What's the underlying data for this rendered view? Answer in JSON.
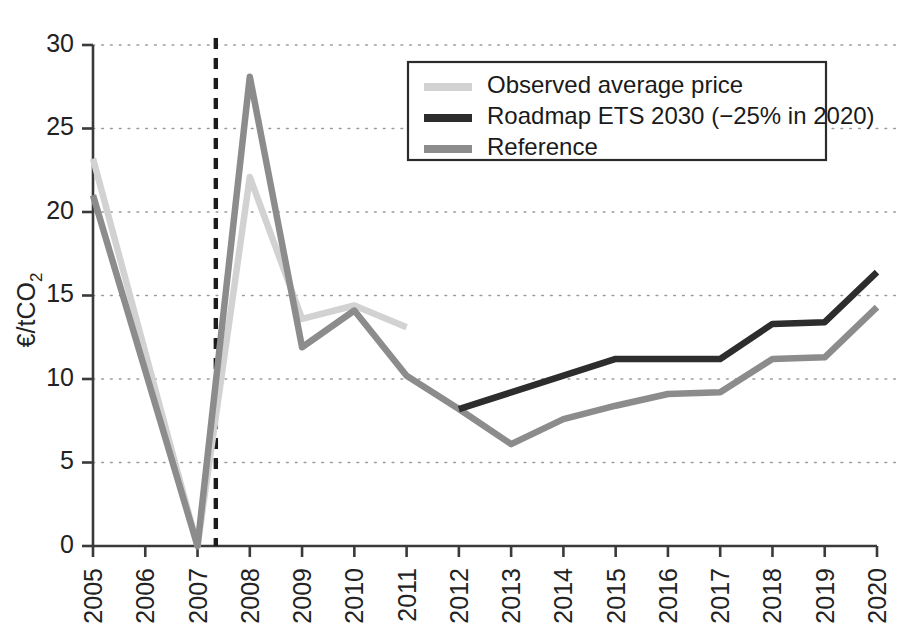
{
  "chart_data": {
    "type": "line",
    "title": "",
    "xlabel": "",
    "ylabel": "€/tCO2",
    "ylabel_base": "€/tCO",
    "ylabel_sub": "2",
    "categories": [
      "2005",
      "2006",
      "2007",
      "2008",
      "2009",
      "2010",
      "2011",
      "2012",
      "2013",
      "2014",
      "2015",
      "2016",
      "2017",
      "2018",
      "2019",
      "2020"
    ],
    "x": [
      2005,
      2006,
      2007,
      2008,
      2009,
      2010,
      2011,
      2012,
      2013,
      2014,
      2015,
      2016,
      2017,
      2018,
      2019,
      2020
    ],
    "xlim": [
      2005,
      2020
    ],
    "ylim": [
      0,
      30
    ],
    "yticks": [
      0,
      5,
      10,
      15,
      20,
      25,
      30
    ],
    "ytick_labels": [
      "0",
      "5",
      "10",
      "15",
      "20",
      "25",
      "30"
    ],
    "grid": true,
    "grid_axis": "y",
    "legend_position": "top-center-right",
    "series": [
      {
        "name": "Observed average price",
        "color": "#d2d2d2",
        "x": [
          2005,
          2006,
          2007,
          2008,
          2009,
          2010,
          2011
        ],
        "values": [
          23.2,
          null,
          0.0,
          22.1,
          13.6,
          14.4,
          13.1
        ]
      },
      {
        "name": "Roadmap ETS 2030 (−25% in 2020)",
        "color": "#2d2d2d",
        "x": [
          2012,
          2013,
          2014,
          2015,
          2016,
          2017,
          2018,
          2019,
          2020
        ],
        "values": [
          8.2,
          9.2,
          10.2,
          11.2,
          11.2,
          11.2,
          13.3,
          13.4,
          16.4
        ]
      },
      {
        "name": "Reference",
        "color": "#8c8c8c",
        "x": [
          2005,
          2006,
          2007,
          2008,
          2009,
          2010,
          2011,
          2012,
          2013,
          2014,
          2015,
          2016,
          2017,
          2018,
          2019,
          2020
        ],
        "values": [
          21.0,
          null,
          0.0,
          28.1,
          11.9,
          14.1,
          10.2,
          8.2,
          6.1,
          7.6,
          8.4,
          9.1,
          9.2,
          11.2,
          11.3,
          14.3
        ]
      }
    ],
    "annotations": [
      {
        "name": "vertical-divider",
        "type": "vline",
        "x": 2007.35,
        "style": "dashed",
        "color": "#1b1b1b"
      }
    ]
  },
  "legend": {
    "entries": [
      {
        "label": "Observed average price",
        "color": "#d2d2d2"
      },
      {
        "label": "Roadmap ETS 2030 (−25% in 2020)",
        "color": "#2d2d2d"
      },
      {
        "label": "Reference",
        "color": "#8c8c8c"
      }
    ]
  }
}
